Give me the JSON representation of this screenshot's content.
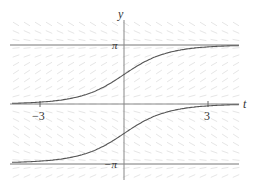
{
  "chart_data": {
    "type": "line",
    "title": "",
    "xlabel": "t",
    "ylabel": "y",
    "x_ticks": [
      {
        "value": -3,
        "label": "−3"
      },
      {
        "value": 3,
        "label": "3"
      }
    ],
    "y_ticks": [
      {
        "value": 3.14159,
        "label": "π"
      },
      {
        "value": -3.14159,
        "label": "−π"
      }
    ],
    "xlim": [
      -4.1,
      4.1
    ],
    "ylim": [
      -4.1,
      4.4
    ],
    "grid": false,
    "legend": null,
    "background": "slope field (direction field)",
    "equilibrium_lines": [
      {
        "name": "y = π",
        "y": 3.14159
      },
      {
        "name": "y = 0",
        "y": 0
      },
      {
        "name": "y = −π",
        "y": -3.14159
      }
    ],
    "series": [
      {
        "name": "upper solution curve",
        "x": [
          -4,
          -3,
          -2,
          -1,
          0,
          1,
          2,
          3,
          4
        ],
        "y": [
          0.04,
          0.1,
          0.27,
          0.71,
          1.57,
          2.43,
          2.87,
          3.04,
          3.1
        ]
      },
      {
        "name": "lower solution curve",
        "x": [
          -4,
          -3,
          -2,
          -1,
          0,
          1,
          2,
          3,
          4
        ],
        "y": [
          -3.1,
          -3.04,
          -2.87,
          -2.43,
          -1.57,
          -0.71,
          -0.27,
          -0.1,
          -0.04
        ]
      }
    ]
  },
  "labels": {
    "y_axis": "y",
    "t_axis": "t",
    "pi": "π",
    "neg_pi": "−π",
    "tick_neg3": "−3",
    "tick_3": "3"
  },
  "colors": {
    "axis": "#888888",
    "curve": "#555555",
    "equilibrium": "#777777",
    "field": "#e6e6e6"
  }
}
